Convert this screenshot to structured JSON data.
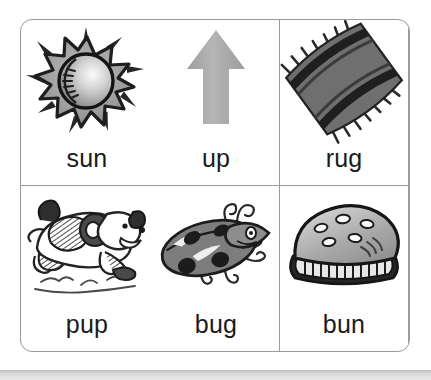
{
  "worksheet": {
    "title": "short u picture word grid",
    "rows": [
      {
        "cells": [
          {
            "word": "sun",
            "icon": "sun-icon"
          },
          {
            "word": "up",
            "icon": "up-arrow-icon"
          },
          {
            "word": "rug",
            "icon": "rug-icon"
          }
        ]
      },
      {
        "cells": [
          {
            "word": "pup",
            "icon": "puppy-icon"
          },
          {
            "word": "bug",
            "icon": "ladybug-icon"
          },
          {
            "word": "bun",
            "icon": "bun-icon"
          }
        ]
      }
    ]
  },
  "colors": {
    "border": "#9a9a9a",
    "word_text": "#1b1b1b",
    "background": "#ffffff",
    "art_dark": "#2b2b2b",
    "art_mid": "#8a8a8a",
    "art_light": "#c9c9c9",
    "arrow_gray": "#aeaeae",
    "page_strip": "#d8d8d8"
  }
}
